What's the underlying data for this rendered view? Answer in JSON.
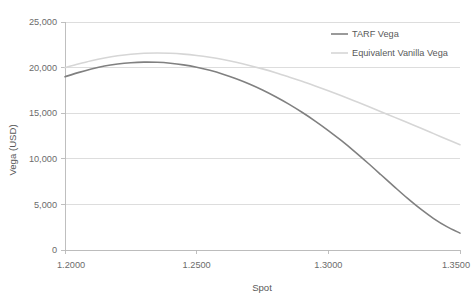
{
  "chart_data": {
    "type": "line",
    "title": "",
    "xlabel": "Spot",
    "ylabel": "Vega (USD)",
    "xlim": [
      1.2,
      1.35
    ],
    "ylim": [
      0,
      25000
    ],
    "grid": true,
    "legend_position": "top-right",
    "x_ticks": [
      "1.2000",
      "1.2500",
      "1.3000",
      "1.3500"
    ],
    "x_tick_values": [
      1.2,
      1.25,
      1.3,
      1.35
    ],
    "y_ticks": [
      "0",
      "5,000",
      "10,000",
      "15,000",
      "20,000",
      "25,000"
    ],
    "y_tick_values": [
      0,
      5000,
      10000,
      15000,
      20000,
      25000
    ],
    "series": [
      {
        "name": "TARF Vega",
        "color": "#808080",
        "width": 1.6,
        "x": [
          1.2,
          1.205,
          1.21,
          1.215,
          1.22,
          1.225,
          1.23,
          1.235,
          1.24,
          1.245,
          1.25,
          1.255,
          1.26,
          1.265,
          1.27,
          1.275,
          1.28,
          1.285,
          1.29,
          1.295,
          1.3,
          1.305,
          1.31,
          1.315,
          1.32,
          1.325,
          1.33,
          1.335,
          1.34,
          1.345,
          1.35
        ],
        "values": [
          19000,
          19450,
          19850,
          20180,
          20400,
          20540,
          20600,
          20580,
          20480,
          20300,
          20040,
          19700,
          19280,
          18780,
          18200,
          17540,
          16800,
          15990,
          15100,
          14140,
          13100,
          11980,
          10790,
          9540,
          8250,
          6950,
          5680,
          4500,
          3450,
          2560,
          1850
        ]
      },
      {
        "name": "Equivalent Vanilla Vega",
        "color": "#d6d6d6",
        "width": 1.6,
        "x": [
          1.2,
          1.205,
          1.21,
          1.215,
          1.22,
          1.225,
          1.23,
          1.235,
          1.24,
          1.245,
          1.25,
          1.255,
          1.26,
          1.265,
          1.27,
          1.275,
          1.28,
          1.285,
          1.29,
          1.295,
          1.3,
          1.305,
          1.31,
          1.315,
          1.32,
          1.325,
          1.33,
          1.335,
          1.34,
          1.345,
          1.35
        ],
        "values": [
          20000,
          20400,
          20760,
          21060,
          21300,
          21470,
          21570,
          21600,
          21570,
          21480,
          21330,
          21130,
          20880,
          20580,
          20240,
          19860,
          19440,
          18980,
          18500,
          17990,
          17460,
          16910,
          16340,
          15760,
          15170,
          14570,
          13970,
          13370,
          12760,
          12150,
          11540
        ]
      }
    ],
    "annotations": []
  },
  "legend": {
    "items": [
      {
        "label": "TARF Vega"
      },
      {
        "label": "Equivalent Vanilla Vega"
      }
    ]
  }
}
